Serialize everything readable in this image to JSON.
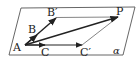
{
  "diagram": {
    "plane": {
      "label": "α",
      "corners": [
        [
          21,
          8
        ],
        [
          135,
          7
        ],
        [
          123,
          55
        ],
        [
          9,
          55
        ]
      ],
      "stroke": "#444444"
    },
    "points": {
      "A": {
        "label": "A",
        "x": 25,
        "y": 45,
        "label_x": 13,
        "label_y": 52
      },
      "B": {
        "label": "B",
        "x": 36,
        "y": 36,
        "label_x": 28,
        "label_y": 33
      },
      "B_prime": {
        "label": "B′",
        "x": 56,
        "y": 18,
        "label_x": 48,
        "label_y": 16
      },
      "C": {
        "label": "C",
        "x": 44,
        "y": 45,
        "label_x": 41,
        "label_y": 56
      },
      "C_prime": {
        "label": "C′",
        "x": 82,
        "y": 45,
        "label_x": 82,
        "label_y": 56
      },
      "P": {
        "label": "P",
        "x": 118,
        "y": 17,
        "label_x": 117,
        "label_y": 15
      }
    },
    "vectors": [
      {
        "from": "A",
        "to": "B",
        "style": "bold-arrow"
      },
      {
        "from": "A",
        "to": "B_prime",
        "style": "bold-arrow"
      },
      {
        "from": "A",
        "to": "C",
        "style": "bold-arrow"
      },
      {
        "from": "A",
        "to": "C_prime",
        "style": "bold-arrow"
      },
      {
        "from": "A",
        "to": "P",
        "style": "bold-arrow"
      }
    ],
    "segments": [
      {
        "from": "B_prime",
        "to": "P",
        "style": "thin"
      },
      {
        "from": "C_prime",
        "to": "P",
        "style": "thin"
      }
    ],
    "colors": {
      "line": "#222222",
      "thin_line": "#555555",
      "background": "#ffffff"
    }
  }
}
